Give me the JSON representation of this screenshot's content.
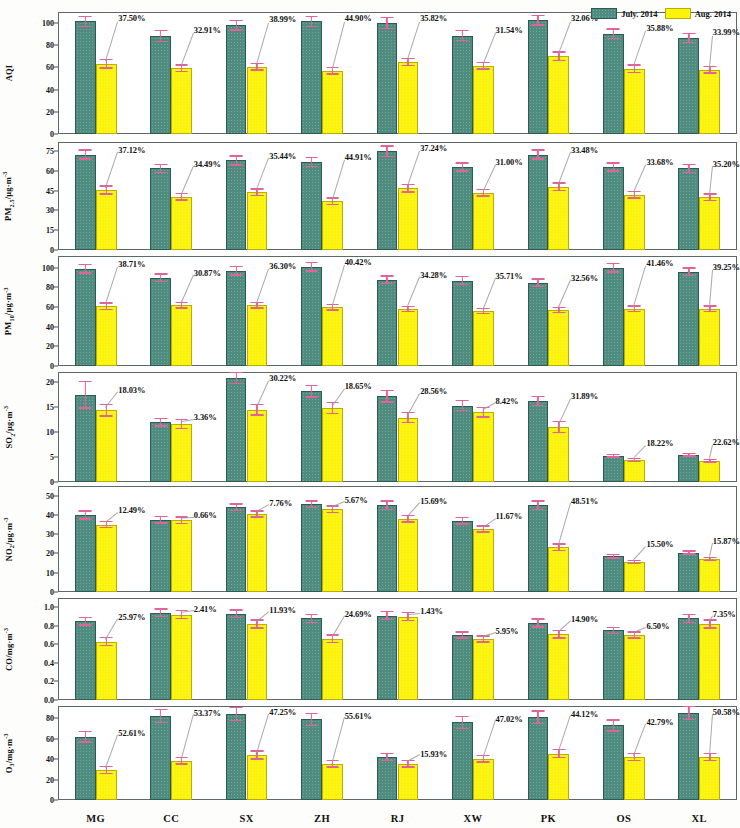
{
  "legend": {
    "position": "top-right",
    "entries": [
      {
        "label": "July. 2014",
        "color": "#4f8c80",
        "key": "july"
      },
      {
        "label": "Aug. 2014",
        "color": "#fbf30a",
        "key": "aug"
      }
    ]
  },
  "axis": {
    "categories": [
      "MG",
      "CC",
      "SX",
      "ZH",
      "RJ",
      "XW",
      "PK",
      "OS",
      "XL"
    ]
  },
  "chart_data": {
    "type": "bar",
    "title": "",
    "xlabel": "",
    "grid": false,
    "legend_position": "top-right",
    "categories": [
      "MG",
      "CC",
      "SX",
      "ZH",
      "RJ",
      "XW",
      "PK",
      "OS",
      "XL"
    ],
    "series_names": [
      "July. 2014",
      "Aug. 2014"
    ],
    "panels": [
      {
        "ylabel": "AQI",
        "ylabel_html": "AQI",
        "ylim": [
          0,
          110
        ],
        "ticks": [
          0,
          20,
          40,
          60,
          80,
          100
        ],
        "tick_labels": [
          "0",
          "20",
          "40",
          "60",
          "80",
          "100"
        ],
        "series": [
          {
            "name": "July. 2014",
            "values": [
              101.5,
              88.5,
              98.0,
              101.5,
              100.2,
              88.8,
              102.5,
              90.5,
              86.5
            ],
            "errors": [
              5.0,
              5.5,
              5.0,
              5.0,
              5.5,
              5.0,
              5.0,
              5.0,
              4.5
            ]
          },
          {
            "name": "Aug. 2014",
            "values": [
              63.5,
              59.5,
              60.5,
              57.0,
              65.0,
              61.5,
              70.0,
              59.0,
              58.0
            ],
            "errors": [
              4.5,
              3.5,
              3.5,
              3.5,
              4.0,
              3.5,
              4.5,
              4.0,
              3.5
            ]
          }
        ],
        "reduction_labels": [
          "37.50%",
          "32.91%",
          "38.99%",
          "44.90%",
          "35.82%",
          "31.54%",
          "32.06%",
          "35.88%",
          "33.99%"
        ]
      },
      {
        "ylabel": "PM2.5 /ug·m-3",
        "ylabel_html": "PM<sub>2.5</sub>/μg·m<sup>-3</sup>",
        "ylim": [
          0,
          82
        ],
        "ticks": [
          0,
          15,
          30,
          45,
          60,
          75
        ],
        "tick_labels": [
          "0",
          "15",
          "30",
          "45",
          "60",
          "75"
        ],
        "series": [
          {
            "name": "July. 2014",
            "values": [
              72.5,
              62.0,
              68.0,
              67.0,
              75.0,
              63.0,
              72.5,
              63.0,
              62.0
            ],
            "errors": [
              4.0,
              3.5,
              4.0,
              4.0,
              4.5,
              3.5,
              4.0,
              3.5,
              3.5
            ]
          },
          {
            "name": "Aug. 2014",
            "values": [
              45.5,
              40.5,
              44.0,
              37.0,
              47.0,
              43.5,
              48.0,
              42.0,
              40.0
            ],
            "errors": [
              3.5,
              3.0,
              3.0,
              3.0,
              3.5,
              3.0,
              3.5,
              3.0,
              3.0
            ]
          }
        ],
        "reduction_labels": [
          "37.12%",
          "34.49%",
          "35.44%",
          "44.91%",
          "37.24%",
          "31.00%",
          "33.48%",
          "33.68%",
          "35.20%"
        ]
      },
      {
        "ylabel": "PM10 /ug·m-3",
        "ylabel_html": "PM<sub>10</sub>/μg·m<sup>-3</sup>",
        "ylim": [
          0,
          112
        ],
        "ticks": [
          0,
          20,
          40,
          60,
          80,
          100
        ],
        "tick_labels": [
          "0",
          "20",
          "40",
          "60",
          "80",
          "100"
        ],
        "series": [
          {
            "name": "July. 2014",
            "values": [
              99.0,
              90.0,
              97.0,
              101.0,
              88.0,
              87.0,
              85.0,
              100.0,
              96.0
            ],
            "errors": [
              5.0,
              4.5,
              5.0,
              5.0,
              4.5,
              5.0,
              4.5,
              5.0,
              4.5
            ]
          },
          {
            "name": "Aug. 2014",
            "values": [
              61.0,
              62.0,
              62.0,
              60.0,
              58.0,
              56.0,
              57.0,
              58.5,
              58.5
            ],
            "errors": [
              4.0,
              3.5,
              3.5,
              3.5,
              3.5,
              3.5,
              3.5,
              3.5,
              3.5
            ]
          }
        ],
        "reduction_labels": [
          "38.71%",
          "30.87%",
          "36.30%",
          "40.42%",
          "34.28%",
          "35.71%",
          "32.56%",
          "41.46%",
          "39.25%"
        ]
      },
      {
        "ylabel": "SO2 /ug·m-3",
        "ylabel_html": "SO<sub>2</sub>/μg·m<sup>-3</sup>",
        "ylim": [
          0,
          22
        ],
        "ticks": [
          0,
          5,
          10,
          15,
          20
        ],
        "tick_labels": [
          "0",
          "5",
          "10",
          "15",
          "20"
        ],
        "series": [
          {
            "name": "July. 2014",
            "values": [
              17.5,
              12.0,
              20.8,
              18.2,
              17.2,
              15.3,
              16.2,
              5.3,
              5.5
            ],
            "errors": [
              2.8,
              0.9,
              1.2,
              1.3,
              1.3,
              1.1,
              1.0,
              0.4,
              0.4
            ]
          },
          {
            "name": "Aug. 2014",
            "values": [
              14.4,
              11.6,
              14.5,
              14.8,
              12.9,
              14.0,
              11.0,
              4.4,
              4.3
            ],
            "errors": [
              1.3,
              1.0,
              1.2,
              1.2,
              1.1,
              1.1,
              1.2,
              0.4,
              0.4
            ]
          }
        ],
        "reduction_labels": [
          "18.03%",
          "3.36%",
          "30.22%",
          "18.65%",
          "28.56%",
          "8.42%",
          "31.89%",
          "18.22%",
          "22.62%"
        ]
      },
      {
        "ylabel": "NO2 /ug·m-3",
        "ylabel_html": "NO<sub>2</sub>/μg·m<sup>-3</sup>",
        "ylim": [
          0,
          55
        ],
        "ticks": [
          0,
          10,
          20,
          30,
          40,
          50
        ],
        "tick_labels": [
          "0",
          "10",
          "20",
          "30",
          "40",
          "50"
        ],
        "series": [
          {
            "name": "July. 2014",
            "values": [
              40.0,
              37.5,
              44.0,
              45.5,
              45.0,
              37.0,
              45.0,
              18.5,
              20.5
            ],
            "errors": [
              2.5,
              2.0,
              2.0,
              2.0,
              2.5,
              2.0,
              2.5,
              1.2,
              1.2
            ]
          },
          {
            "name": "Aug. 2014",
            "values": [
              35.0,
              37.2,
              40.5,
              43.0,
              38.0,
              32.7,
              23.2,
              15.6,
              17.2
            ],
            "errors": [
              2.0,
              2.0,
              2.0,
              2.0,
              2.0,
              2.0,
              2.0,
              1.2,
              1.2
            ]
          }
        ],
        "reduction_labels": [
          "12.49%",
          "0.66%",
          "7.76%",
          "5.67%",
          "15.69%",
          "11.67%",
          "48.51%",
          "15.50%",
          "15.87%"
        ]
      },
      {
        "ylabel": "CO /mg·m-3",
        "ylabel_html": "CO/mg·m<sup>-3</sup>",
        "ylim": [
          0,
          1.1
        ],
        "ticks": [
          0,
          0.2,
          0.4,
          0.6,
          0.8,
          1.0
        ],
        "tick_labels": [
          "0.0",
          "0.2",
          "0.4",
          "0.6",
          "0.8",
          "1.0"
        ],
        "series": [
          {
            "name": "July. 2014",
            "values": [
              0.85,
              0.94,
              0.93,
              0.88,
              0.91,
              0.7,
              0.83,
              0.75,
              0.88
            ],
            "errors": [
              0.05,
              0.05,
              0.05,
              0.05,
              0.05,
              0.04,
              0.05,
              0.04,
              0.05
            ]
          },
          {
            "name": "Aug. 2014",
            "values": [
              0.63,
              0.92,
              0.82,
              0.66,
              0.9,
              0.66,
              0.71,
              0.7,
              0.82
            ],
            "errors": [
              0.05,
              0.05,
              0.05,
              0.05,
              0.05,
              0.04,
              0.05,
              0.04,
              0.05
            ]
          }
        ],
        "reduction_labels": [
          "25.97%",
          "2.41%",
          "11.93%",
          "24.69%",
          "1.43%",
          "5.95%",
          "14.90%",
          "6.50%",
          "7.35%"
        ]
      },
      {
        "ylabel": "O3 /mg·m-3",
        "ylabel_html": "O<sub>3</sub>/mg·m<sup>-3</sup>",
        "ylim": [
          0,
          92
        ],
        "ticks": [
          0,
          20,
          40,
          60,
          80
        ],
        "tick_labels": [
          "0",
          "20",
          "40",
          "60",
          "80"
        ],
        "series": [
          {
            "name": "July. 2014",
            "values": [
              62.0,
              82.0,
              84.0,
              79.0,
              42.0,
              76.0,
              81.0,
              73.0,
              85.0
            ],
            "errors": [
              6.0,
              7.0,
              7.0,
              6.5,
              4.0,
              6.5,
              7.0,
              6.0,
              7.0
            ]
          },
          {
            "name": "Aug. 2014",
            "values": [
              29.5,
              38.5,
              44.0,
              35.5,
              35.5,
              40.5,
              45.5,
              42.0,
              42.0
            ],
            "errors": [
              4.0,
              4.0,
              4.5,
              4.0,
              4.0,
              4.0,
              4.5,
              4.0,
              4.0
            ]
          }
        ],
        "reduction_labels": [
          "52.61%",
          "53.37%",
          "47.25%",
          "55.61%",
          "15.93%",
          "47.02%",
          "44.12%",
          "42.79%",
          "50.58%"
        ]
      }
    ]
  }
}
